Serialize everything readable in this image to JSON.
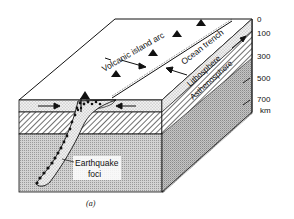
{
  "figure": {
    "caption": "(a)",
    "labels": {
      "volcanic_island_arc": "Volcanic island arc",
      "ocean_trench": "Ocean trench",
      "lithosphere": "Lithosphere",
      "asthenosphere": "Asthenosphere",
      "earthquake_foci_line1": "Earthquake",
      "earthquake_foci_line2": "foci"
    },
    "depth_scale": {
      "unit": "km",
      "ticks": [
        "0",
        "100",
        "300",
        "500",
        "700"
      ]
    },
    "colors": {
      "ink": "#111111",
      "background": "#ffffff",
      "mantle_fill": "#c8c8c8",
      "lithosphere_fill": "#e6e6e6"
    }
  }
}
